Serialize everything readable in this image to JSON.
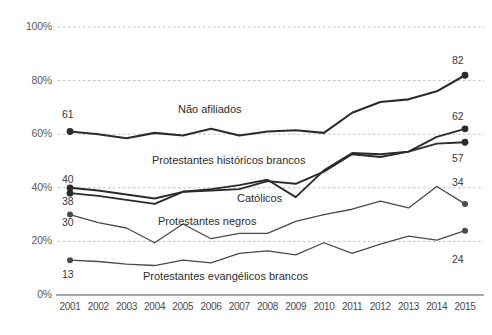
{
  "chart_data": {
    "type": "line",
    "title": "",
    "xlabel": "",
    "ylabel": "",
    "grid": true,
    "legend_position": "inline-annotations",
    "ylim": [
      0,
      100
    ],
    "ytick_labels": [
      "0%",
      "20%",
      "40%",
      "60%",
      "80%",
      "100%"
    ],
    "ytick_values": [
      0,
      20,
      40,
      60,
      80,
      100
    ],
    "categories": [
      "2001",
      "2002",
      "2003",
      "2004",
      "2005",
      "2006",
      "2007",
      "2008",
      "2009",
      "2010",
      "2011",
      "2012",
      "2013",
      "2014",
      "2015"
    ],
    "series": [
      {
        "name": "Não afiliados",
        "label": "Não afiliados",
        "start_value": 61,
        "end_value": 82,
        "start_label": "61",
        "end_label": "82",
        "color": "#2b2b2b",
        "width": 2.1,
        "values": [
          61,
          60,
          58.5,
          60.5,
          59.5,
          62,
          59.5,
          61,
          61.5,
          60.5,
          68,
          72,
          73,
          76,
          82
        ]
      },
      {
        "name": "Protestantes históricos brancos",
        "label": "Protestantes históricos brancos",
        "start_value": 40,
        "end_value": 62,
        "start_label": "40",
        "end_label": "62",
        "color": "#2b2b2b",
        "width": 1.9,
        "values": [
          40,
          39,
          37.5,
          36,
          38.5,
          39,
          39.5,
          42.5,
          41.5,
          46,
          52.5,
          51.5,
          53.5,
          59,
          62
        ]
      },
      {
        "name": "Católicos",
        "label": "Católicos",
        "start_value": 38,
        "end_value": 57,
        "start_label": "38",
        "end_label": "57",
        "color": "#2b2b2b",
        "width": 1.9,
        "values": [
          38,
          37,
          35.5,
          34,
          38.5,
          39.5,
          41,
          43,
          36.5,
          46.5,
          53,
          52.5,
          53.5,
          56.5,
          57
        ]
      },
      {
        "name": "Protestantes negros",
        "label": "Protestantes negros",
        "start_value": 30,
        "end_value": 34,
        "start_label": "30",
        "end_label": "34",
        "color": "#4a4a4a",
        "width": 1.3,
        "values": [
          30,
          27,
          25,
          19.5,
          26.5,
          21,
          23,
          23,
          27.5,
          30,
          32,
          35,
          32.5,
          40.5,
          34
        ]
      },
      {
        "name": "Protestantes evangélicos brancos",
        "label": "Protestantes evangélicos brancos",
        "start_value": 13,
        "end_value": 24,
        "start_label": "13",
        "end_label": "24",
        "color": "#4a4a4a",
        "width": 1.3,
        "values": [
          13,
          12.5,
          11.5,
          11,
          13,
          12,
          15.5,
          16.5,
          15,
          19.5,
          15.5,
          19,
          22,
          20.5,
          24
        ]
      }
    ],
    "annotations": [
      {
        "text": "Não afiliados",
        "x": 178,
        "y": 103
      },
      {
        "text": "Protestantes históricos brancos",
        "x": 152,
        "y": 154
      },
      {
        "text": "Católicos",
        "x": 237,
        "y": 192
      },
      {
        "text": "Protestantes negros",
        "x": 158,
        "y": 215
      },
      {
        "text": "Protestantes evangélicos brancos",
        "x": 143,
        "y": 270
      }
    ],
    "value_labels": [
      {
        "text": "61",
        "x": 62,
        "y": 108
      },
      {
        "text": "82",
        "x": 452,
        "y": 54
      },
      {
        "text": "62",
        "x": 452,
        "y": 110
      },
      {
        "text": "57",
        "x": 452,
        "y": 152
      },
      {
        "text": "40",
        "x": 62,
        "y": 173
      },
      {
        "text": "34",
        "x": 452,
        "y": 176
      },
      {
        "text": "38",
        "x": 62,
        "y": 195
      },
      {
        "text": "30",
        "x": 62,
        "y": 216
      },
      {
        "text": "24",
        "x": 452,
        "y": 253
      },
      {
        "text": "13",
        "x": 62,
        "y": 268
      }
    ]
  },
  "colors": {
    "background": "#ffffff",
    "gridline": "#b8b8b8",
    "axis": "#8a8a8a",
    "line_dark": "#2b2b2b",
    "line_light": "#4a4a4a",
    "text": "#3a3a3a"
  }
}
